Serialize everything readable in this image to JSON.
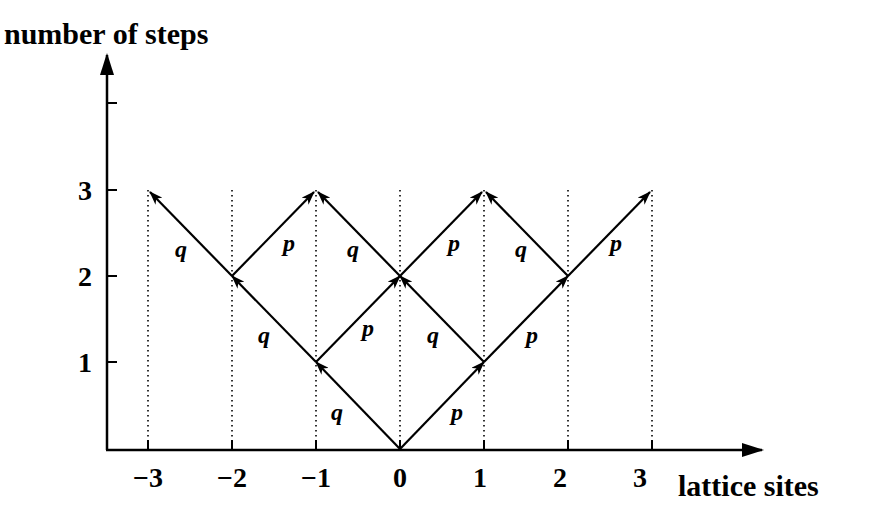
{
  "diagram": {
    "y_axis": {
      "title": "number of steps",
      "ticks": [
        "1",
        "2",
        "3"
      ]
    },
    "x_axis": {
      "title": "lattice sites",
      "ticks": [
        "−3",
        "−2",
        "−1",
        "0",
        "1",
        "2",
        "3"
      ]
    },
    "probabilities": {
      "right": "p",
      "left": "q"
    },
    "edges": [
      {
        "from": [
          0,
          0
        ],
        "to": [
          -1,
          1
        ],
        "label": "q"
      },
      {
        "from": [
          0,
          0
        ],
        "to": [
          1,
          1
        ],
        "label": "p"
      },
      {
        "from": [
          -1,
          1
        ],
        "to": [
          -2,
          2
        ],
        "label": "q"
      },
      {
        "from": [
          -1,
          1
        ],
        "to": [
          0,
          2
        ],
        "label": "p"
      },
      {
        "from": [
          1,
          1
        ],
        "to": [
          0,
          2
        ],
        "label": "q"
      },
      {
        "from": [
          1,
          1
        ],
        "to": [
          2,
          2
        ],
        "label": "p"
      },
      {
        "from": [
          -2,
          2
        ],
        "to": [
          -3,
          3
        ],
        "label": "q"
      },
      {
        "from": [
          -2,
          2
        ],
        "to": [
          -1,
          3
        ],
        "label": "p"
      },
      {
        "from": [
          0,
          2
        ],
        "to": [
          -1,
          3
        ],
        "label": "q"
      },
      {
        "from": [
          0,
          2
        ],
        "to": [
          1,
          3
        ],
        "label": "p"
      },
      {
        "from": [
          2,
          2
        ],
        "to": [
          1,
          3
        ],
        "label": "q"
      },
      {
        "from": [
          2,
          2
        ],
        "to": [
          3,
          3
        ],
        "label": "p"
      }
    ],
    "colors": {
      "ink": "#000000",
      "background": "#ffffff"
    }
  }
}
